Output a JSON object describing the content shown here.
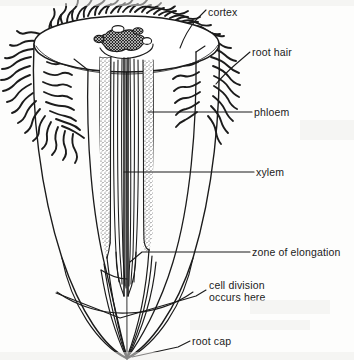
{
  "figure": {
    "background_color": "#fdfdfc",
    "ink_color": "#1b1b1b"
  },
  "labels": [
    {
      "id": "cortex",
      "text": "cortex",
      "x": 208,
      "y": 6,
      "leader": true
    },
    {
      "id": "root-hair",
      "text": "root hair",
      "x": 252,
      "y": 46,
      "leader": true
    },
    {
      "id": "phloem",
      "text": "phloem",
      "x": 254,
      "y": 106,
      "leader": true
    },
    {
      "id": "xylem",
      "text": "xylem",
      "x": 256,
      "y": 166,
      "leader": true
    },
    {
      "id": "zone-of-elongation",
      "text": "zone of elongation",
      "x": 252,
      "y": 246,
      "leader": true
    },
    {
      "id": "cell-division-1",
      "text": "cell division",
      "x": 209,
      "y": 279,
      "leader": true
    },
    {
      "id": "cell-division-2",
      "text": "occurs here",
      "x": 209,
      "y": 291,
      "leader": false
    },
    {
      "id": "root-cap",
      "text": "root cap",
      "x": 192,
      "y": 335,
      "leader": true
    }
  ],
  "structures": [
    {
      "id": "cut-surface",
      "name": "cut surface ellipse"
    },
    {
      "id": "cortex-body",
      "name": "cortex"
    },
    {
      "id": "root-hairs",
      "name": "root hairs"
    },
    {
      "id": "xylem-strand",
      "name": "xylem"
    },
    {
      "id": "phloem-strip-left",
      "name": "phloem left"
    },
    {
      "id": "phloem-strip-right",
      "name": "phloem right"
    },
    {
      "id": "vascular-bundle",
      "name": "vascular bundle cross-section"
    },
    {
      "id": "root-cap-body",
      "name": "root cap"
    },
    {
      "id": "zone-boundary",
      "name": "zone of elongation boundary"
    },
    {
      "id": "division-boundary",
      "name": "cell division boundary"
    }
  ]
}
